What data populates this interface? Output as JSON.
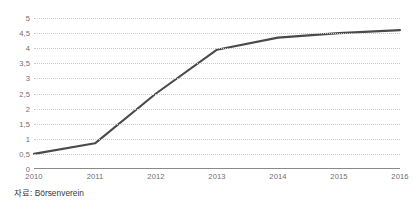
{
  "chart_data": {
    "type": "line",
    "title": "",
    "subtitle": "",
    "xlabel": "",
    "ylabel": "",
    "categories": [
      "2010",
      "2011",
      "2012",
      "2013",
      "2014",
      "2015",
      "2016"
    ],
    "x": [
      2010,
      2011,
      2012,
      2013,
      2014,
      2015,
      2016
    ],
    "values": [
      0.5,
      0.85,
      2.5,
      3.95,
      4.35,
      4.5,
      4.6
    ],
    "series": [
      {
        "name": "",
        "values": [
          0.5,
          0.85,
          2.5,
          3.95,
          4.35,
          4.5,
          4.6
        ]
      }
    ],
    "ylim": [
      0,
      5
    ],
    "y_ticks": [
      0,
      0.5,
      1,
      1.5,
      2,
      2.5,
      3,
      3.5,
      4,
      4.5,
      5
    ],
    "y_tick_labels": [
      "0",
      "0,5",
      "1",
      "1,5",
      "2",
      "2,5",
      "3",
      "3,5",
      "4",
      "4,5",
      "5"
    ],
    "x_tick_labels": [
      "2010",
      "2011",
      "2012",
      "2013",
      "2014",
      "2015",
      "2016"
    ],
    "grid": true,
    "grid_axis": "y",
    "legend": false,
    "legend_position": "none",
    "line_color": "#4a4a4a",
    "grid_color": "#c8c8c8",
    "axis_color": "#8a8a8a",
    "tick_label_color": "#6e6e6e",
    "background_color": "#ffffff"
  },
  "footer": {
    "source_note": "자료: Börsenverein"
  }
}
